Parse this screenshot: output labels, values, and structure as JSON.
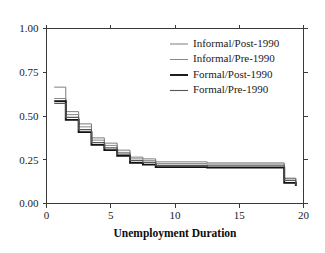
{
  "figure": {
    "background_color": "#ffffff",
    "frame_color": "#3a3a3a"
  },
  "chart_data": {
    "type": "line",
    "title": "",
    "subtitle": "",
    "xlabel": "Unemployment Duration",
    "ylabel": "",
    "xlim": [
      0,
      20
    ],
    "ylim": [
      0.0,
      1.0
    ],
    "xticks": [
      0,
      5,
      10,
      15,
      20
    ],
    "xtick_labels": [
      "0",
      "5",
      "10",
      "15",
      "20"
    ],
    "yticks": [
      0.0,
      0.25,
      0.5,
      0.75,
      1.0
    ],
    "ytick_labels": [
      "0.00",
      "0.25",
      "0.50",
      "0.75",
      "1.00"
    ],
    "grid": false,
    "step_style": "post",
    "legend_position": "upper-right-inside",
    "series": [
      {
        "name": "Informal/Post-1990",
        "color": "#6e6e6e",
        "line_width": 0.9,
        "x": [
          0.6,
          1.5,
          2.5,
          3.5,
          4.5,
          5.5,
          6.5,
          7.5,
          8.5,
          12.5,
          18.5,
          19.4
        ],
        "values": [
          0.665,
          0.525,
          0.455,
          0.375,
          0.345,
          0.305,
          0.265,
          0.255,
          0.238,
          0.232,
          0.145,
          0.112
        ]
      },
      {
        "name": "Informal/Pre-1990",
        "color": "#7a7a7a",
        "line_width": 0.9,
        "x": [
          0.6,
          1.5,
          2.5,
          3.5,
          4.5,
          5.5,
          6.5,
          7.5,
          8.5,
          12.5,
          18.5,
          19.4
        ],
        "values": [
          0.6,
          0.508,
          0.438,
          0.362,
          0.332,
          0.292,
          0.255,
          0.245,
          0.228,
          0.225,
          0.142,
          0.108
        ]
      },
      {
        "name": "Formal/Post-1990",
        "color": "#111111",
        "line_width": 1.9,
        "x": [
          0.6,
          1.5,
          2.5,
          3.5,
          4.5,
          5.5,
          6.5,
          7.5,
          8.5,
          12.5,
          18.5,
          19.4
        ],
        "values": [
          0.585,
          0.478,
          0.408,
          0.335,
          0.305,
          0.272,
          0.232,
          0.222,
          0.208,
          0.205,
          0.118,
          0.1
        ]
      },
      {
        "name": "Formal/Pre-1990",
        "color": "#565656",
        "line_width": 1.1,
        "x": [
          0.6,
          1.5,
          2.5,
          3.5,
          4.5,
          5.5,
          6.5,
          7.5,
          8.5,
          12.5,
          18.5,
          19.4
        ],
        "values": [
          0.572,
          0.492,
          0.422,
          0.348,
          0.318,
          0.282,
          0.245,
          0.235,
          0.218,
          0.215,
          0.132,
          0.105
        ]
      }
    ],
    "legend_entries": [
      {
        "label": "Informal/Post-1990",
        "color": "#6e6e6e",
        "line_width": 0.9
      },
      {
        "label": "Informal/Pre-1990",
        "color": "#7a7a7a",
        "line_width": 0.9
      },
      {
        "label": "Formal/Post-1990",
        "color": "#111111",
        "line_width": 1.9
      },
      {
        "label": "Formal/Pre-1990",
        "color": "#565656",
        "line_width": 1.1
      }
    ]
  }
}
